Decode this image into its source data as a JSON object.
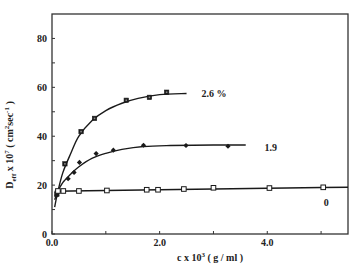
{
  "chart_data": {
    "type": "scatter",
    "title": "",
    "xlabel": "c x 10³ ( g / ml )",
    "ylabel": "D_eff x 10⁷ ( cm²sec⁻¹ )",
    "xlim": [
      0,
      5.5
    ],
    "ylim": [
      0,
      90
    ],
    "grid": false,
    "legend_position": "inline labels at right end of curves",
    "x_ticks": [
      0,
      1,
      2,
      3,
      4,
      5
    ],
    "x_tick_labels": [
      "0.0",
      "",
      "2.0",
      "",
      "4.0",
      ""
    ],
    "y_ticks": [
      0,
      10,
      20,
      30,
      40,
      50,
      60,
      70,
      80
    ],
    "y_tick_labels": [
      "0",
      "",
      "20",
      "",
      "40",
      "",
      "60",
      "",
      "80"
    ],
    "series": [
      {
        "name": "2.6 %",
        "marker": "filled-square",
        "x": [
          0.09,
          0.24,
          0.54,
          0.79,
          1.38,
          1.81,
          2.13
        ],
        "y": [
          16.3,
          28.7,
          41.9,
          47.3,
          54.7,
          55.9,
          58.0
        ],
        "fit_curve": [
          [
            0.05,
            11
          ],
          [
            0.1,
            16.5
          ],
          [
            0.2,
            25
          ],
          [
            0.35,
            33
          ],
          [
            0.5,
            40
          ],
          [
            0.75,
            46.5
          ],
          [
            1.0,
            50.5
          ],
          [
            1.3,
            53.5
          ],
          [
            1.6,
            55.5
          ],
          [
            2.0,
            57
          ],
          [
            2.5,
            57.5
          ]
        ]
      },
      {
        "name": "1.9",
        "marker": "filled-diamond",
        "x": [
          0.09,
          0.3,
          0.41,
          0.51,
          0.82,
          1.14,
          1.7,
          2.49,
          3.27
        ],
        "y": [
          15.9,
          22.6,
          25.2,
          29.3,
          32.9,
          34.3,
          36.3,
          36.2,
          35.9
        ],
        "fit_curve": [
          [
            0.05,
            14
          ],
          [
            0.1,
            17
          ],
          [
            0.2,
            21
          ],
          [
            0.35,
            24.5
          ],
          [
            0.5,
            27.5
          ],
          [
            0.75,
            31
          ],
          [
            1.0,
            33
          ],
          [
            1.3,
            34.6
          ],
          [
            1.7,
            35.8
          ],
          [
            2.2,
            36.2
          ],
          [
            3.0,
            36.4
          ],
          [
            3.6,
            36.4
          ]
        ]
      },
      {
        "name": "0",
        "marker": "open-square",
        "x": [
          0.11,
          0.21,
          0.5,
          1.02,
          1.76,
          1.97,
          2.45,
          3.0,
          4.04,
          5.04
        ],
        "y": [
          17.6,
          17.6,
          17.6,
          17.8,
          18.1,
          18.1,
          18.4,
          18.9,
          18.8,
          19.1
        ],
        "fit_curve": [
          [
            0.05,
            17.5
          ],
          [
            1.0,
            17.8
          ],
          [
            2.0,
            18.1
          ],
          [
            3.0,
            18.4
          ],
          [
            4.0,
            18.7
          ],
          [
            5.0,
            19.0
          ],
          [
            5.5,
            19.1
          ]
        ]
      }
    ],
    "annotations": [
      {
        "text": "2.6 %",
        "x": 2.78,
        "y": 57.5
      },
      {
        "text": "1.9",
        "x": 3.95,
        "y": 35.5
      },
      {
        "text": "0",
        "x": 5.05,
        "y": 13.0
      }
    ]
  },
  "axes": {
    "xlabel_main": "c x 10",
    "xlabel_sup": "3",
    "xlabel_units": " ( g / ml )",
    "ylabel_main": "D",
    "ylabel_sub": "eff",
    "ylabel_mid": " x 10",
    "ylabel_sup": "7",
    "ylabel_units_open": " ( cm",
    "ylabel_units_sup": "2",
    "ylabel_units_sec": "sec",
    "ylabel_units_sup2": "-1",
    "ylabel_units_close": " )"
  },
  "colors": {
    "ink": "#1a1a1a",
    "frame": "#333333",
    "background": "#ffffff"
  }
}
